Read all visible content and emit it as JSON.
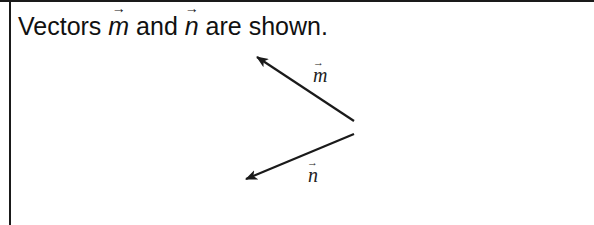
{
  "prompt": {
    "prefix": "Vectors ",
    "vector1": "m",
    "middle": " and ",
    "vector2": "n",
    "suffix": " are shown.",
    "arrow_glyph": "→"
  },
  "diagram": {
    "vectors": [
      {
        "name": "m",
        "label": "m",
        "tail": [
          354,
          121
        ],
        "tip": [
          255,
          56
        ]
      },
      {
        "name": "n",
        "label": "n",
        "tail": [
          354,
          134
        ],
        "tip": [
          244,
          180
        ]
      }
    ],
    "line_color": "#1a1a1a"
  }
}
